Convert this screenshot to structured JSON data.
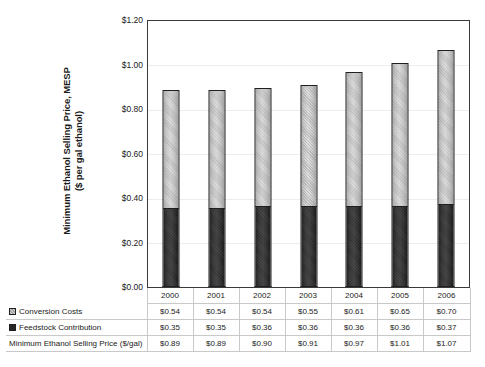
{
  "chart_data": {
    "type": "bar",
    "subtype": "stacked-column",
    "title": "",
    "xlabel": "",
    "ylabel": "Minimum Ethanol Selling Price, MESP ($ per gal ethanol)",
    "ylabel_lines": [
      "Minimum Ethanol Selling Price, MESP",
      "($ per gal ethanol)"
    ],
    "categories": [
      "2000",
      "2001",
      "2002",
      "2003",
      "2004",
      "2005",
      "2006"
    ],
    "series": [
      {
        "name": "Feedstock Contribution",
        "values": [
          0.35,
          0.35,
          0.36,
          0.36,
          0.36,
          0.36,
          0.37
        ],
        "labels": [
          "$0.35",
          "$0.35",
          "$0.36",
          "$0.36",
          "$0.36",
          "$0.36",
          "$0.37"
        ],
        "color": "#2a2a2a",
        "stack_order": "bottom"
      },
      {
        "name": "Conversion Costs",
        "values": [
          0.54,
          0.54,
          0.54,
          0.55,
          0.61,
          0.65,
          0.7
        ],
        "labels": [
          "$0.54",
          "$0.54",
          "$0.54",
          "$0.55",
          "$0.61",
          "$0.65",
          "$0.70"
        ],
        "color": "#d8d8d8",
        "stack_order": "top"
      }
    ],
    "totals": {
      "name": "Minimum Ethanol Selling Price ($/gal)",
      "values": [
        0.89,
        0.89,
        0.9,
        0.91,
        0.97,
        1.01,
        1.07
      ],
      "labels": [
        "$0.89",
        "$0.89",
        "$0.90",
        "$0.91",
        "$0.97",
        "$1.01",
        "$1.07"
      ]
    },
    "ylim": [
      0.0,
      1.2
    ],
    "ytick_values": [
      0.0,
      0.2,
      0.4,
      0.6,
      0.8,
      1.0,
      1.2
    ],
    "ytick_labels": [
      "$0.00",
      "$0.20",
      "$0.40",
      "$0.60",
      "$0.80",
      "$1.00",
      "$1.20"
    ],
    "grid": true,
    "legend_position": "data-table-row-headers"
  },
  "data_table": {
    "year_row_header": "",
    "rows": [
      {
        "key": "conversion",
        "label": "Conversion Costs",
        "swatch": "light-hatched-square-icon"
      },
      {
        "key": "feedstock",
        "label": "Feedstock Contribution",
        "swatch": "dark-filled-square-icon"
      },
      {
        "key": "total",
        "label": "Minimum Ethanol Selling Price ($/gal)",
        "swatch": "none"
      }
    ]
  }
}
